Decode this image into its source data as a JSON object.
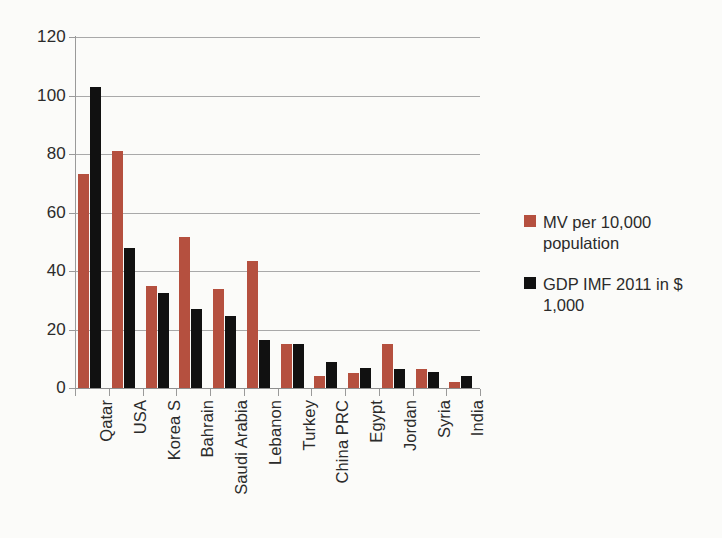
{
  "chart_data": {
    "type": "bar",
    "title": "",
    "subtitle": "",
    "xlabel": "",
    "ylabel": "",
    "ylim": [
      0,
      120
    ],
    "ytick_step": 20,
    "yticks": [
      120,
      100,
      80,
      60,
      40,
      20,
      0
    ],
    "grid": true,
    "legend_position": "right",
    "categories": [
      "Qatar",
      "USA",
      "Korea S",
      "Bahrain",
      "Saudi Arabia",
      "Lebanon",
      "Turkey",
      "China PRC",
      "Egypt",
      "Jordan",
      "Syria",
      "India"
    ],
    "series": [
      {
        "name": "MV per 10,000 population",
        "color": "#b5503f",
        "values": [
          73,
          81,
          35,
          51.5,
          34,
          43.5,
          15,
          4,
          5,
          15,
          6.5,
          2
        ]
      },
      {
        "name": "GDP IMF 2011 in $ 1,000",
        "color": "#111111",
        "values": [
          103,
          48,
          32.5,
          27,
          24.5,
          16.5,
          15,
          9,
          7,
          6.5,
          5.5,
          4
        ]
      }
    ]
  },
  "legend": {
    "entries": [
      {
        "label": "MV per 10,000 population",
        "swatch": "red-square-icon"
      },
      {
        "label": "GDP IMF 2011 in $ 1,000",
        "swatch": "black-square-icon"
      }
    ]
  },
  "colors": {
    "series_mv": "#b5503f",
    "series_gdp": "#111111",
    "gridline": "#a9a9a9",
    "axis": "#9a9a9a",
    "background": "#fbfbf9",
    "text": "#2b2b2b"
  }
}
